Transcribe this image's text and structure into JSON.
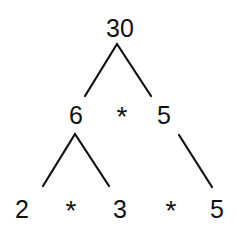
{
  "nodes": {
    "root": "30",
    "level1": {
      "left": "6",
      "operator": "*",
      "right": "5"
    },
    "level2": {
      "a": "2",
      "op1": "*",
      "b": "3",
      "op2": "*",
      "c": "5"
    }
  },
  "edges": [
    {
      "from": "30",
      "to": "6"
    },
    {
      "from": "30",
      "to": "5"
    },
    {
      "from": "6",
      "to": "2"
    },
    {
      "from": "6",
      "to": "3"
    },
    {
      "from": "5",
      "to": "5"
    }
  ],
  "colors": {
    "ink": "#111111",
    "background": "#ffffff"
  }
}
